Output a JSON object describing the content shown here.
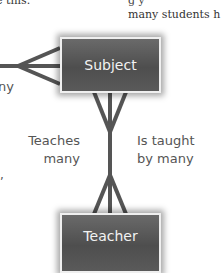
{
  "header_text": {
    "left_fragment": "e this.",
    "right_line1": "g    y",
    "right_line2": "many students h"
  },
  "entities": {
    "subject": "Subject",
    "teacher": "Teacher"
  },
  "left_label_fragment": "ny",
  "left_comma": ",",
  "relationship_labels": {
    "left_line1": "Teaches",
    "left_line2": "many",
    "right_line1": "Is taught",
    "right_line2": "by many"
  },
  "colors": {
    "line": "#555555",
    "entity_fill": "#5a5a5a",
    "entity_border": "#efefef",
    "entity_text": "#f2f2f2"
  }
}
